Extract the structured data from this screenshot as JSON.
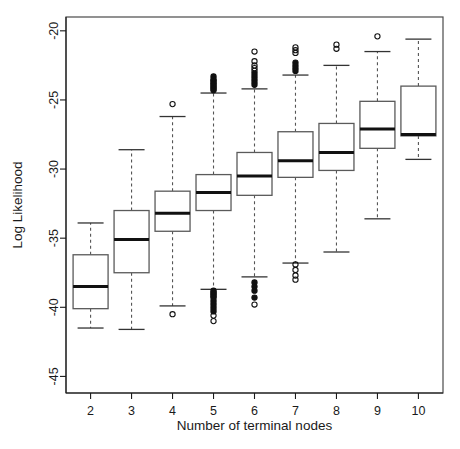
{
  "chart_data": {
    "type": "box",
    "title": "",
    "xlabel": "Number of terminal nodes",
    "ylabel": "Log Likelihood",
    "xtick_labels": [
      "2",
      "3",
      "4",
      "5",
      "6",
      "7",
      "8",
      "9",
      "10"
    ],
    "ytick_labels": [
      "-20",
      "-25",
      "-30",
      "-35",
      "-40",
      "-45"
    ],
    "ytick_values": [
      -20,
      -25,
      -30,
      -35,
      -40,
      -45
    ],
    "ylim": [
      -46.2,
      -19.0
    ],
    "xlim": [
      1.4,
      10.6
    ],
    "grid": false,
    "legend": null,
    "categories": [
      2,
      3,
      4,
      5,
      6,
      7,
      8,
      9,
      10
    ],
    "boxes": [
      {
        "category": "2",
        "whisker_low": -41.5,
        "q1": -40.1,
        "median": -38.5,
        "q3": -36.2,
        "whisker_high": -33.9,
        "outliers": []
      },
      {
        "category": "3",
        "whisker_low": -41.6,
        "q1": -37.5,
        "median": -35.1,
        "q3": -33.0,
        "whisker_high": -28.6,
        "outliers": []
      },
      {
        "category": "4",
        "whisker_low": -39.9,
        "q1": -34.5,
        "median": -33.2,
        "q3": -31.6,
        "whisker_high": -26.2,
        "outliers": [
          -25.3,
          -40.5
        ]
      },
      {
        "category": "5",
        "whisker_low": -38.7,
        "q1": -33.0,
        "median": -31.7,
        "q3": -30.4,
        "whisker_high": -24.5,
        "outliers": [
          -23.3,
          -23.5,
          -23.6,
          -23.7,
          -23.8,
          -23.9,
          -24.0,
          -24.1,
          -24.2,
          -24.3,
          -38.8,
          -38.9,
          -39.0,
          -39.1,
          -39.2,
          -39.3,
          -39.5,
          -39.7,
          -39.9,
          -40.1,
          -40.3,
          -40.6,
          -41.0
        ],
        "dense_outliers_top": true,
        "dense_outliers_bottom": true
      },
      {
        "category": "6",
        "whisker_low": -37.8,
        "q1": -31.9,
        "median": -30.5,
        "q3": -28.8,
        "whisker_high": -24.2,
        "outliers": [
          -21.5,
          -22.2,
          -22.5,
          -22.7,
          -22.9,
          -23.1,
          -23.3,
          -23.5,
          -23.7,
          -23.9,
          -38.2,
          -38.5,
          -38.8,
          -39.3,
          -39.8
        ],
        "dense_outliers_top": true,
        "dense_outliers_bottom": true
      },
      {
        "category": "7",
        "whisker_low": -36.8,
        "q1": -30.6,
        "median": -29.4,
        "q3": -27.3,
        "whisker_high": -23.2,
        "outliers": [
          -21.2,
          -21.4,
          -21.6,
          -22.3,
          -22.5,
          -22.7,
          -22.9,
          -36.9,
          -37.3,
          -37.7,
          -38.0
        ],
        "dense_outliers_top": true,
        "dense_outliers_bottom": false
      },
      {
        "category": "8",
        "whisker_low": -36.0,
        "q1": -30.1,
        "median": -28.8,
        "q3": -26.7,
        "whisker_high": -22.5,
        "outliers": [
          -21.0,
          -21.3
        ],
        "dense_outliers_top": false,
        "dense_outliers_bottom": false
      },
      {
        "category": "9",
        "whisker_low": -33.6,
        "q1": -28.5,
        "median": -27.1,
        "q3": -25.1,
        "whisker_high": -21.5,
        "outliers": [
          -20.4
        ],
        "dense_outliers_top": false,
        "dense_outliers_bottom": false
      },
      {
        "category": "10",
        "whisker_low": -29.3,
        "q1": -27.6,
        "median": -27.5,
        "q3": -24.0,
        "whisker_high": -20.6,
        "outliers": [],
        "dense_outliers_top": false,
        "dense_outliers_bottom": false
      }
    ]
  }
}
